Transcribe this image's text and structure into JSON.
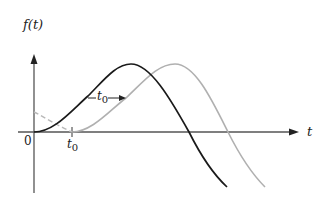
{
  "figure": {
    "y_axis_label": "f(t)",
    "x_axis_label": "t",
    "origin_label": "0",
    "shift_tick_label": "t",
    "shift_tick_subscript": "0",
    "shift_arrow_label": "t",
    "shift_arrow_subscript": "0"
  },
  "colors": {
    "axis": "#555555",
    "original_curve": "#1a1a1a",
    "shifted_curve": "#b0b0b0",
    "text": "#222222"
  },
  "curves": [
    {
      "name": "f(t)",
      "style": "solid",
      "color": "#1a1a1a"
    },
    {
      "name": "f(t - t0)",
      "style": "solid (dashed before t0)",
      "color": "#b0b0b0"
    }
  ]
}
